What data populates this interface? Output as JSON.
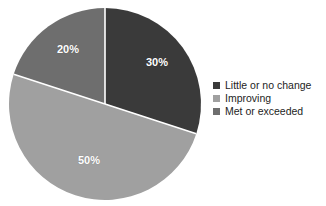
{
  "chart_data": {
    "type": "pie",
    "title": "",
    "categories": [
      "Little or no change",
      "Improving",
      "Met or exceeded"
    ],
    "values": [
      30,
      50,
      20
    ],
    "data_labels": [
      "30%",
      "50%",
      "20%"
    ],
    "colors": [
      "#3a3a3a",
      "#a0a0a0",
      "#6e6e6e"
    ],
    "start_angle_deg": 0,
    "direction": "clockwise",
    "label_color": "#ffffff",
    "separator_color": "#ffffff",
    "legend_position": "right",
    "background": "#ffffff"
  },
  "pie": {
    "center_x": 105,
    "center_y": 104,
    "radius": 96,
    "labels": [
      {
        "text": "30%",
        "x": 157,
        "y": 62
      },
      {
        "text": "50%",
        "x": 89,
        "y": 160
      },
      {
        "text": "20%",
        "x": 68,
        "y": 49
      }
    ]
  },
  "legend": {
    "items": [
      {
        "label": "Little or no change",
        "color": "#3a3a3a"
      },
      {
        "label": "Improving",
        "color": "#a0a0a0"
      },
      {
        "label": "Met or exceeded",
        "color": "#6e6e6e"
      }
    ]
  }
}
